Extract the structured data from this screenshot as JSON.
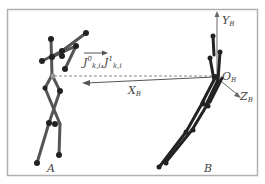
{
  "diagram": {
    "type": "skeleton-coordinate-frame-diagram",
    "figures": [
      {
        "id": "A",
        "label": "A",
        "description": "left skeleton figure, arm raised"
      },
      {
        "id": "B",
        "label": "B",
        "description": "right skeleton figure, leaning, origin of local frame"
      }
    ],
    "axes": {
      "origin": {
        "label": "O",
        "subscript": "B"
      },
      "y": {
        "label": "Y",
        "subscript": "B"
      },
      "x": {
        "label": "X",
        "subscript": "B"
      },
      "z": {
        "label": "Z",
        "subscript": "B"
      }
    },
    "vector_label": {
      "first": {
        "base": "J",
        "sup": "0",
        "sub": "k,i"
      },
      "second": {
        "base": "J",
        "sup": "1",
        "sub": "k,i"
      }
    },
    "colors": {
      "border": "#b0b0b0",
      "skeleton_a": "#555555",
      "skeleton_b": "#222222",
      "joint": "#222222",
      "axis": "#666666",
      "label": "#444444"
    }
  }
}
